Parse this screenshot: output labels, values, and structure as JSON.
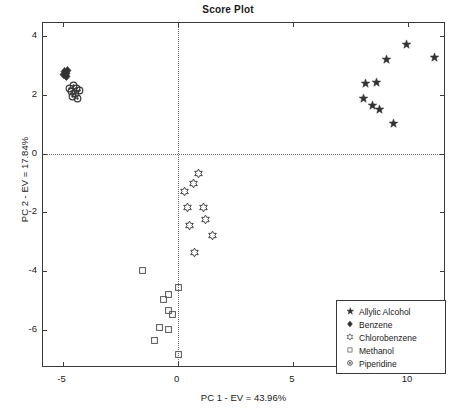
{
  "chart_data": {
    "type": "scatter",
    "title": "Score Plot",
    "xlabel": "PC 1 - EV = 43.96%",
    "ylabel": "PC 2 - EV = 17.84%",
    "xlim": [
      -5.85,
      11.65
    ],
    "ylim": [
      -7.3,
      4.45
    ],
    "xticks": [
      -5,
      0,
      5,
      10
    ],
    "xticklabels": [
      "-5",
      "0",
      "5",
      "10"
    ],
    "yticks": [
      4,
      2,
      0,
      -2,
      -4,
      -6
    ],
    "yticklabels": [
      "4",
      "2",
      "0",
      "-2",
      "-4",
      "-6"
    ],
    "grid": "zero-reference-dotted-lines-at-x0-and-y0",
    "legend_position": "lower-right-inside",
    "series": [
      {
        "name": "Allylic Alcohol",
        "marker": "pentagram-star",
        "color": "#333333",
        "points": [
          [
            8.05,
            1.88
          ],
          [
            8.15,
            2.4
          ],
          [
            8.65,
            2.42
          ],
          [
            8.45,
            1.63
          ],
          [
            8.75,
            1.52
          ],
          [
            9.05,
            3.22
          ],
          [
            9.35,
            1.03
          ],
          [
            9.95,
            3.72
          ],
          [
            11.15,
            3.28
          ]
        ]
      },
      {
        "name": "Benzene",
        "marker": "diamond",
        "color": "#333333",
        "points": [
          [
            -4.92,
            2.8
          ],
          [
            -4.84,
            2.74
          ],
          [
            -4.88,
            2.66
          ],
          [
            -4.78,
            2.82
          ],
          [
            -4.95,
            2.7
          ],
          [
            -4.82,
            2.62
          ]
        ]
      },
      {
        "name": "Chlorobenzene",
        "marker": "hexagram",
        "color": "#444444",
        "points": [
          [
            0.92,
            -0.68
          ],
          [
            0.68,
            -1.0
          ],
          [
            0.3,
            -1.3
          ],
          [
            0.42,
            -1.84
          ],
          [
            1.12,
            -1.82
          ],
          [
            1.22,
            -2.25
          ],
          [
            0.52,
            -2.46
          ],
          [
            1.52,
            -2.8
          ],
          [
            0.72,
            -3.38
          ]
        ]
      },
      {
        "name": "Methanol",
        "marker": "square",
        "color": "#555555",
        "points": [
          [
            -1.52,
            -3.98
          ],
          [
            0.02,
            -4.55
          ],
          [
            -0.42,
            -4.78
          ],
          [
            -0.62,
            -4.95
          ],
          [
            -0.38,
            -5.33
          ],
          [
            -0.22,
            -5.48
          ],
          [
            -0.78,
            -5.93
          ],
          [
            -0.42,
            -5.98
          ],
          [
            -1.02,
            -6.35
          ],
          [
            0.02,
            -6.85
          ]
        ]
      },
      {
        "name": "Piperidine",
        "marker": "circle",
        "color": "#3a3a3a",
        "points": [
          [
            -4.52,
            2.32
          ],
          [
            -4.38,
            2.22
          ],
          [
            -4.62,
            2.12
          ],
          [
            -4.42,
            2.04
          ],
          [
            -4.28,
            2.14
          ],
          [
            -4.55,
            1.96
          ],
          [
            -4.35,
            1.88
          ],
          [
            -4.7,
            2.22
          ]
        ]
      }
    ]
  },
  "legend": {
    "items": [
      {
        "label": "Allylic Alcohol",
        "marker": "pentagram-star"
      },
      {
        "label": "Benzene",
        "marker": "diamond"
      },
      {
        "label": "Chlorobenzene",
        "marker": "hexagram"
      },
      {
        "label": "Methanol",
        "marker": "square"
      },
      {
        "label": "Piperidine",
        "marker": "circle"
      }
    ]
  }
}
